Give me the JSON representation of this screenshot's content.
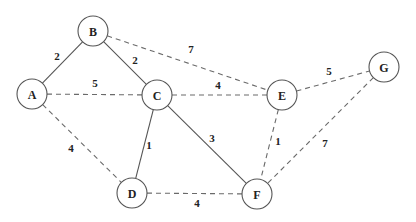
{
  "graph": {
    "nodes": [
      {
        "id": "A",
        "x": 32,
        "y": 94
      },
      {
        "id": "B",
        "x": 93,
        "y": 31
      },
      {
        "id": "C",
        "x": 157,
        "y": 95
      },
      {
        "id": "D",
        "x": 132,
        "y": 193
      },
      {
        "id": "E",
        "x": 282,
        "y": 95
      },
      {
        "id": "F",
        "x": 257,
        "y": 194
      },
      {
        "id": "G",
        "x": 384,
        "y": 67
      }
    ],
    "edges": [
      {
        "from": "A",
        "to": "B",
        "weight": "2",
        "style": "solid",
        "lx": 57,
        "ly": 56
      },
      {
        "from": "B",
        "to": "C",
        "weight": "2",
        "style": "solid",
        "lx": 135,
        "ly": 60
      },
      {
        "from": "A",
        "to": "C",
        "weight": "5",
        "style": "dashed",
        "lx": 95,
        "ly": 83
      },
      {
        "from": "B",
        "to": "E",
        "weight": "7",
        "style": "dashed",
        "lx": 191,
        "ly": 49
      },
      {
        "from": "C",
        "to": "E",
        "weight": "4",
        "style": "dashed",
        "lx": 218,
        "ly": 85
      },
      {
        "from": "E",
        "to": "G",
        "weight": "5",
        "style": "dashed",
        "lx": 329,
        "ly": 71
      },
      {
        "from": "A",
        "to": "D",
        "weight": "4",
        "style": "dashed",
        "lx": 71,
        "ly": 148
      },
      {
        "from": "C",
        "to": "D",
        "weight": "1",
        "style": "solid",
        "lx": 149,
        "ly": 145
      },
      {
        "from": "C",
        "to": "F",
        "weight": "3",
        "style": "solid",
        "lx": 212,
        "ly": 138
      },
      {
        "from": "E",
        "to": "F",
        "weight": "1",
        "style": "dashed",
        "lx": 278,
        "ly": 141
      },
      {
        "from": "D",
        "to": "F",
        "weight": "4",
        "style": "dashed",
        "lx": 197,
        "ly": 203
      },
      {
        "from": "G",
        "to": "F",
        "weight": "7",
        "style": "dashed",
        "lx": 325,
        "ly": 143
      }
    ],
    "node_radius": 15
  }
}
